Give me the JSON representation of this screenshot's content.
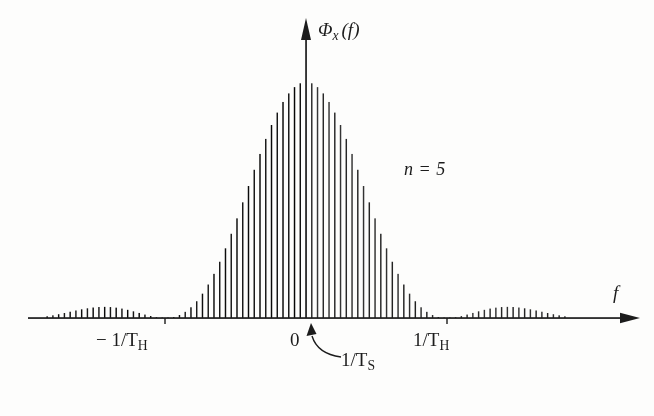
{
  "figure": {
    "name": "power-spectral-density-line-spectrum",
    "background_color": "#fdfdfc",
    "ink_color": "#1c1c1c"
  },
  "labels": {
    "y_axis": "Φx (f)",
    "y_axis_base": "Φ",
    "y_axis_sub": "x",
    "y_axis_arg": "(f)",
    "x_axis": "f",
    "annotation_n": "n = 5",
    "tick_negative": "− 1/TH",
    "tick_negative_prefix": "− 1/T",
    "tick_negative_sub": "H",
    "tick_zero": "0",
    "tick_positive": "1/TH",
    "tick_positive_prefix": "1/T",
    "tick_positive_sub": "H",
    "annotation_spacing": "1/TS",
    "annotation_spacing_prefix": "1/T",
    "annotation_spacing_sub": "S"
  },
  "chart_data": {
    "type": "bar",
    "title": "",
    "subtitle": "",
    "xlabel": "f",
    "ylabel": "Φx (f)",
    "legend": [],
    "legend_position": "none",
    "grid": false,
    "annotations": [
      {
        "text": "n = 5",
        "x": 0.62,
        "y": 0.62
      },
      {
        "text": "1/TS",
        "x": 0.035,
        "y": 0.0,
        "note": "line spacing, curved arrow points to first spectral line right of origin"
      }
    ],
    "axis": {
      "x_tick_values": [
        -1,
        0,
        1
      ],
      "x_tick_labels": [
        "− 1/TH",
        "0",
        "1/TH"
      ],
      "x_unit": "1/TH",
      "xlim": [
        -2.45,
        2.45
      ],
      "ylim": [
        0,
        1.0
      ],
      "y_ticks": [],
      "x_axis_arrow": true,
      "y_axis_arrow": true,
      "y_axis_at_x": 0
    },
    "envelope": {
      "function": "sinc^2",
      "description": "squared sinc envelope with nulls at integer multiples of 1/TH; n = 5 holding intervals",
      "main_lobe_peak": 1.0,
      "first_sidelobe_peak": 0.046,
      "second_sidelobe_peak": 0.016,
      "nulls_at": [
        -2,
        -1,
        1,
        2
      ]
    },
    "lines": {
      "description": "discrete spectral lines spaced by 1/TS; 1/TS = (1/TH)/24.5 in these axis units",
      "spacing_in_xunits": 0.0408,
      "count": 120,
      "x_min": -2.45,
      "x_max": 2.45,
      "gap_at_zero": true,
      "gap_reason": "y-axis drawn over the f = 0 line"
    },
    "values_note": "heights y_k = sinc^2(x_k) with x_k = k * 0.0408 in units of 1/TH",
    "sampled_points": [
      {
        "x": 0.0,
        "y": 1.0
      },
      {
        "x": 0.204,
        "y": 0.891
      },
      {
        "x": 0.408,
        "y": 0.605
      },
      {
        "x": 0.612,
        "y": 0.282
      },
      {
        "x": 0.816,
        "y": 0.07
      },
      {
        "x": 1.0,
        "y": 0.0
      },
      {
        "x": 1.224,
        "y": 0.037
      },
      {
        "x": 1.43,
        "y": 0.046
      },
      {
        "x": 1.632,
        "y": 0.028
      },
      {
        "x": 1.836,
        "y": 0.007
      },
      {
        "x": 2.0,
        "y": 0.0
      },
      {
        "x": 2.24,
        "y": 0.012
      },
      {
        "x": 2.45,
        "y": 0.014
      }
    ]
  }
}
